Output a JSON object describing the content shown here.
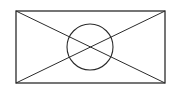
{
  "diagram": {
    "stroke_color": "#2b2b2b",
    "background": "#ffffff",
    "rectangle": {
      "x": 16,
      "y": 11,
      "width": 149,
      "height": 72
    },
    "diagonals": [
      {
        "x1": 16,
        "y1": 11,
        "x2": 165,
        "y2": 83
      },
      {
        "x1": 165,
        "y1": 11,
        "x2": 16,
        "y2": 83
      }
    ],
    "circle": {
      "cx": 90,
      "cy": 47,
      "r": 23
    }
  }
}
